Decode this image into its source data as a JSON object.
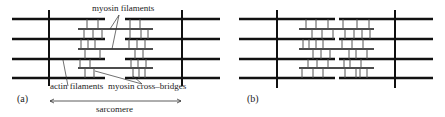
{
  "figure": {
    "panels": [
      {
        "id": "a",
        "label": "(a)"
      },
      {
        "id": "b",
        "label": "(b)"
      }
    ],
    "labels": {
      "myosin_filaments": "myosin filaments",
      "actin_filaments": "actin filaments",
      "cross_bridges": "myosin cross–bridges",
      "sarcomere": "sarcomere"
    },
    "colors": {
      "line": "#111111",
      "bridge": "#555555",
      "text": "#222222"
    }
  }
}
